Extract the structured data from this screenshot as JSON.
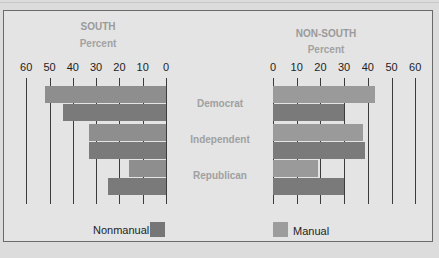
{
  "chart_data": [
    {
      "type": "bar",
      "orientation": "horizontal",
      "title": "SOUTH",
      "subtitle": "Percent",
      "direction": "right-to-left",
      "categories": [
        "Democrat",
        "Independent",
        "Republican"
      ],
      "ticks": [
        60,
        50,
        40,
        30,
        20,
        10,
        0
      ],
      "xlim": [
        0,
        60
      ],
      "series": [
        {
          "name": "Manual",
          "color": "#8e8e8e",
          "values": [
            52,
            33,
            16
          ]
        },
        {
          "name": "Nonmanual",
          "color": "#7a7a7a",
          "values": [
            44,
            33,
            25
          ]
        }
      ],
      "grid": true
    },
    {
      "type": "bar",
      "orientation": "horizontal",
      "title": "NON-SOUTH",
      "subtitle": "Percent",
      "direction": "left-to-right",
      "categories": [
        "Democrat",
        "Independent",
        "Republican"
      ],
      "ticks": [
        0,
        10,
        20,
        30,
        40,
        50,
        60
      ],
      "xlim": [
        0,
        60
      ],
      "series": [
        {
          "name": "Manual",
          "color": "#9a9a9a",
          "values": [
            43,
            38,
            19
          ]
        },
        {
          "name": "Nonmanual",
          "color": "#7a7a7a",
          "values": [
            30,
            39,
            30
          ]
        }
      ],
      "grid": true
    }
  ],
  "labels": {
    "south_title": "SOUTH",
    "south_sub": "Percent",
    "nonsouth_title": "NON-SOUTH",
    "nonsouth_sub": "Percent",
    "categories": [
      "Democrat",
      "Independent",
      "Republican"
    ],
    "ticks_left": [
      "60",
      "50",
      "40",
      "30",
      "20",
      "10",
      "0"
    ],
    "ticks_right": [
      "0",
      "10",
      "20",
      "30",
      "40",
      "50",
      "60"
    ]
  },
  "legend": {
    "nonmanual": "Nonmanual",
    "manual": "Manual",
    "nonmanual_color": "#767676",
    "manual_color": "#9c9c9c"
  }
}
